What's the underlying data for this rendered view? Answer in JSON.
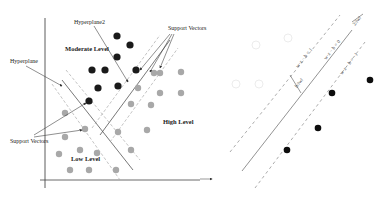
{
  "left_panel": {
    "labels": {
      "hyperplane": "Hyperplane",
      "hyperplane2": "Hyperplane2",
      "support_vectors_top": "Support Vectors",
      "support_vectors_bottom": "Support Vectors",
      "moderate_level": "Moderate Level",
      "high_level": "High Level",
      "low_level": "Low Level"
    },
    "colors": {
      "dark_points": "#1a1a1a",
      "gray_points": "#a8a8a8",
      "axis": "#333333"
    },
    "dark_points": [
      [
        122,
        20
      ],
      [
        132,
        44
      ],
      [
        118,
        57
      ],
      [
        92,
        70
      ],
      [
        105,
        70
      ],
      [
        98,
        88
      ],
      [
        118,
        87
      ],
      [
        138,
        71
      ],
      [
        90,
        100
      ]
    ],
    "gray_points": [
      [
        155,
        73
      ],
      [
        165,
        73
      ],
      [
        181,
        73
      ],
      [
        138,
        88
      ],
      [
        160,
        93
      ],
      [
        181,
        93
      ],
      [
        63,
        113
      ],
      [
        130,
        103
      ],
      [
        151,
        104
      ],
      [
        85,
        129
      ],
      [
        118,
        131
      ],
      [
        147,
        129
      ],
      [
        65,
        137
      ],
      [
        58,
        153
      ],
      [
        80,
        150
      ],
      [
        97,
        153
      ],
      [
        131,
        150
      ],
      [
        69,
        170
      ],
      [
        89,
        170
      ],
      [
        116,
        169
      ]
    ]
  },
  "right_panel": {
    "equations": {
      "upper": "w·x − b = 1",
      "middle": "w·x − b = 0",
      "lower": "w·x − b = −1",
      "margin": "b/‖w‖",
      "width": "2/‖w‖"
    },
    "colors": {
      "dark_points": "#0d0d0d",
      "faint_points": "#eeeeee"
    },
    "dark_points": [
      [
        332,
        93
      ],
      [
        319,
        128
      ],
      [
        287,
        150
      ],
      [
        370,
        80
      ]
    ]
  }
}
